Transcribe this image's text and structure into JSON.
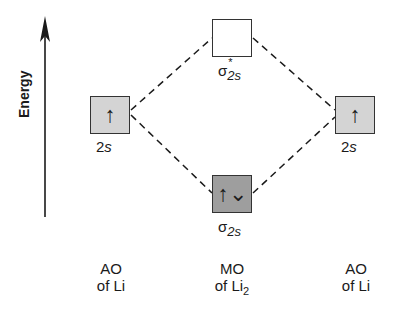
{
  "axis": {
    "label": "Energy"
  },
  "orbitals": {
    "left_ao": {
      "label_num": "2",
      "label_s": "s",
      "electrons": "↑"
    },
    "right_ao": {
      "label_num": "2",
      "label_s": "s",
      "electrons": "↑"
    },
    "sigma_star": {
      "symbol": "σ",
      "sub": "2s",
      "sup": "*",
      "electrons": ""
    },
    "sigma": {
      "symbol": "σ",
      "sub": "2s",
      "electrons": "↑⌄"
    }
  },
  "columns": {
    "left": {
      "line1": "AO",
      "line2": "of Li"
    },
    "middle": {
      "line1": "MO",
      "line2": "of Li",
      "line2_sub": "2"
    },
    "right": {
      "line1": "AO",
      "line2": "of Li"
    }
  },
  "colors": {
    "ao_fill": "#d4d4d4",
    "bonding_fill": "#9e9e9e",
    "antibonding_fill": "#ffffff",
    "line": "#1a1a1a"
  }
}
